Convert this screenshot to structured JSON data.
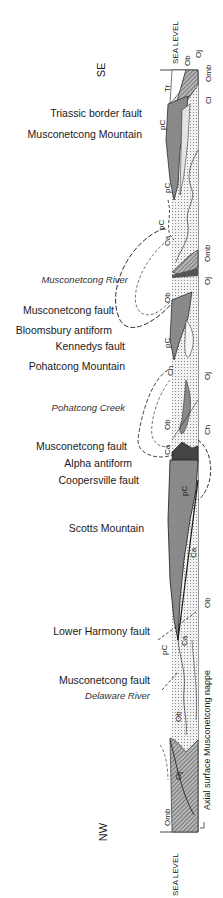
{
  "orientation": {
    "top": "SE",
    "bottom": "NW"
  },
  "sea_level": {
    "top_label": "SEA LEVEL",
    "bottom_label": "SEA LEVEL"
  },
  "features": [
    {
      "label": "Triassic border fault",
      "y": 113,
      "style": "normal"
    },
    {
      "label": "Musconetcong Mountain",
      "y": 134,
      "style": "normal"
    },
    {
      "label": "Musconetcong River",
      "y": 280,
      "style": "italic"
    },
    {
      "label": "Musconetcong fault",
      "y": 310,
      "style": "normal"
    },
    {
      "label": "Bloomsbury antiform",
      "y": 330,
      "style": "normal"
    },
    {
      "label": "Kennedys fault",
      "y": 346,
      "style": "normal"
    },
    {
      "label": "Pohatcong Mountain",
      "y": 366,
      "style": "normal"
    },
    {
      "label": "Pohatcong Creek",
      "y": 408,
      "style": "italic"
    },
    {
      "label": "Musconetcong fault",
      "y": 446,
      "style": "normal"
    },
    {
      "label": "Alpha antiform",
      "y": 463,
      "style": "normal"
    },
    {
      "label": "Coopersville fault",
      "y": 480,
      "style": "normal"
    },
    {
      "label": "Scotts Mountain",
      "y": 528,
      "style": "normal"
    },
    {
      "label": "Lower Harmony fault",
      "y": 631,
      "style": "normal"
    },
    {
      "label": "Musconetcong fault",
      "y": 680,
      "style": "normal"
    },
    {
      "label": "Delaware River",
      "y": 696,
      "style": "italic"
    }
  ],
  "formation_labels": {
    "right_top": [
      "Ob",
      "Oj",
      "Omb",
      "Cl"
    ],
    "triassic": "Tr",
    "precambrian": "pC",
    "allentown": "Ca",
    "hardyston": "Ch",
    "beekmantown": "Ob",
    "jacksonburg": "Oj",
    "martinsburg": "Omb"
  },
  "axial_surface_label": "Axial surface Musconetcong nappe",
  "colors": {
    "ink": "#1a1a1a",
    "dark_fill": "#8a8a8a",
    "light_fill": "#e6e6e6",
    "dot_fill": "#d4d4d4"
  }
}
